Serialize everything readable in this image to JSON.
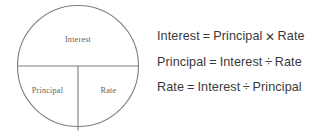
{
  "figure": {
    "line_color": "#7d7d7d",
    "text_color": "#3a3a3a",
    "label_color": "#5f5f5f",
    "background": "#ffffff"
  },
  "diagram": {
    "shape": "circle",
    "top_half_label": "Interest",
    "bottom_left_label": "Principal",
    "bottom_right_label": "Rate"
  },
  "equations": [
    {
      "left": "Interest",
      "equals": "=",
      "operand1": "Principal",
      "operator": "✕",
      "operand2": "Rate"
    },
    {
      "left": "Principal",
      "equals": "=",
      "operand1": "Interest",
      "operator": "÷",
      "operand2": "Rate"
    },
    {
      "left": "Rate",
      "equals": "=",
      "operand1": "Interest",
      "operator": "÷",
      "operand2": "Principal"
    }
  ]
}
